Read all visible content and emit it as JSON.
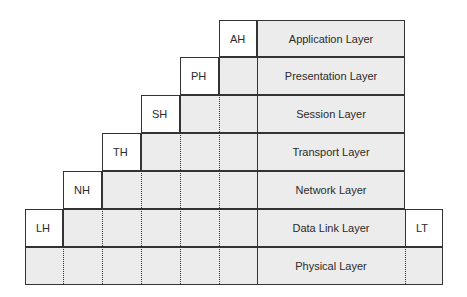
{
  "diagram": {
    "type": "osi-encapsulation",
    "layers": [
      {
        "name": "Application Layer",
        "header": "AH"
      },
      {
        "name": "Presentation Layer",
        "header": "PH"
      },
      {
        "name": "Session Layer",
        "header": "SH"
      },
      {
        "name": "Transport Layer",
        "header": "TH"
      },
      {
        "name": "Network Layer",
        "header": "NH"
      },
      {
        "name": "Data Link Layer",
        "header": "LH",
        "trailer": "LT"
      },
      {
        "name": "Physical Layer"
      }
    ]
  }
}
